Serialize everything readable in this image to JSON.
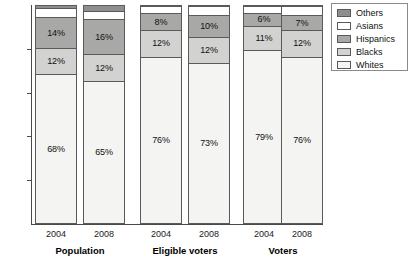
{
  "chart_data": {
    "type": "bar",
    "subtype": "stacked-percentage",
    "title": "",
    "xlabel": "",
    "ylabel": "",
    "ylim": [
      0,
      100
    ],
    "y_ticks": [
      20,
      40,
      60,
      80
    ],
    "grid": false,
    "legend_position": "top-right",
    "categories": [
      "2004",
      "2008",
      "2004",
      "2008",
      "2004",
      "2008"
    ],
    "groups": [
      {
        "name": "Population",
        "years": [
          "2004",
          "2008"
        ]
      },
      {
        "name": "Eligible voters",
        "years": [
          "2004",
          "2008"
        ]
      },
      {
        "name": "Voters",
        "years": [
          "2004",
          "2008"
        ]
      }
    ],
    "series": [
      {
        "name": "Whites",
        "color": "#f4f4f2",
        "values": [
          68,
          65,
          76,
          73,
          79,
          76
        ]
      },
      {
        "name": "Blacks",
        "color": "#d2d2d0",
        "values": [
          12,
          12,
          12,
          12,
          11,
          12
        ]
      },
      {
        "name": "Hispanics",
        "color": "#a8a8a6",
        "values": [
          14,
          16,
          8,
          10,
          6,
          7
        ]
      },
      {
        "name": "Asians",
        "color": "#ffffff",
        "values": [
          4,
          4,
          3,
          4,
          3,
          4
        ]
      },
      {
        "name": "Others",
        "color": "#8e8e8c",
        "values": [
          2,
          3,
          1,
          1,
          1,
          1
        ]
      }
    ],
    "bars": [
      {
        "group": "Population",
        "year": "2004",
        "segments": [
          {
            "series": "Whites",
            "value": 68,
            "label": "68%",
            "show_label": true
          },
          {
            "series": "Blacks",
            "value": 12,
            "label": "12%",
            "show_label": true
          },
          {
            "series": "Hispanics",
            "value": 14,
            "label": "14%",
            "show_label": true
          },
          {
            "series": "Asians",
            "value": 4,
            "label": "",
            "show_label": false
          },
          {
            "series": "Others",
            "value": 2,
            "label": "",
            "show_label": false
          }
        ]
      },
      {
        "group": "Population",
        "year": "2008",
        "segments": [
          {
            "series": "Whites",
            "value": 65,
            "label": "65%",
            "show_label": true
          },
          {
            "series": "Blacks",
            "value": 12,
            "label": "12%",
            "show_label": true
          },
          {
            "series": "Hispanics",
            "value": 16,
            "label": "16%",
            "show_label": true
          },
          {
            "series": "Asians",
            "value": 4,
            "label": "",
            "show_label": false
          },
          {
            "series": "Others",
            "value": 3,
            "label": "",
            "show_label": false
          }
        ]
      },
      {
        "group": "Eligible voters",
        "year": "2004",
        "segments": [
          {
            "series": "Whites",
            "value": 76,
            "label": "76%",
            "show_label": true
          },
          {
            "series": "Blacks",
            "value": 12,
            "label": "12%",
            "show_label": true
          },
          {
            "series": "Hispanics",
            "value": 8,
            "label": "8%",
            "show_label": true
          },
          {
            "series": "Asians",
            "value": 3,
            "label": "",
            "show_label": false
          },
          {
            "series": "Others",
            "value": 1,
            "label": "",
            "show_label": false
          }
        ]
      },
      {
        "group": "Eligible voters",
        "year": "2008",
        "segments": [
          {
            "series": "Whites",
            "value": 73,
            "label": "73%",
            "show_label": true
          },
          {
            "series": "Blacks",
            "value": 12,
            "label": "12%",
            "show_label": true
          },
          {
            "series": "Hispanics",
            "value": 10,
            "label": "10%",
            "show_label": true
          },
          {
            "series": "Asians",
            "value": 4,
            "label": "",
            "show_label": false
          },
          {
            "series": "Others",
            "value": 1,
            "label": "",
            "show_label": false
          }
        ]
      },
      {
        "group": "Voters",
        "year": "2004",
        "segments": [
          {
            "series": "Whites",
            "value": 79,
            "label": "79%",
            "show_label": true
          },
          {
            "series": "Blacks",
            "value": 11,
            "label": "11%",
            "show_label": true
          },
          {
            "series": "Hispanics",
            "value": 6,
            "label": "6%",
            "show_label": true
          },
          {
            "series": "Asians",
            "value": 3,
            "label": "",
            "show_label": false
          },
          {
            "series": "Others",
            "value": 1,
            "label": "",
            "show_label": false
          }
        ]
      },
      {
        "group": "Voters",
        "year": "2008",
        "segments": [
          {
            "series": "Whites",
            "value": 76,
            "label": "76%",
            "show_label": true
          },
          {
            "series": "Blacks",
            "value": 12,
            "label": "12%",
            "show_label": true
          },
          {
            "series": "Hispanics",
            "value": 7,
            "label": "7%",
            "show_label": true
          },
          {
            "series": "Asians",
            "value": 4,
            "label": "",
            "show_label": false
          },
          {
            "series": "Others",
            "value": 1,
            "label": "",
            "show_label": false
          }
        ]
      }
    ],
    "legend": [
      {
        "label": "Others",
        "color": "#8e8e8c"
      },
      {
        "label": "Asians",
        "color": "#ffffff"
      },
      {
        "label": "Hispanics",
        "color": "#a8a8a6"
      },
      {
        "label": "Blacks",
        "color": "#d2d2d0"
      },
      {
        "label": "Whites",
        "color": "#f4f4f2"
      }
    ]
  },
  "axis": {
    "y_tick_labels": [
      "80",
      "60",
      "40",
      "20"
    ]
  },
  "x_axis": {
    "year_labels": [
      "2004",
      "2008",
      "2004",
      "2008",
      "2004",
      "2008"
    ],
    "group_labels": [
      "Population",
      "Eligible voters",
      "Voters"
    ]
  }
}
